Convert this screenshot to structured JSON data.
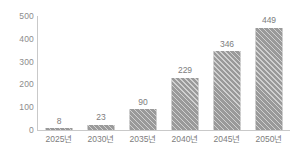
{
  "chart_data": {
    "type": "bar",
    "title": "",
    "subtitle": "",
    "xlabel": "",
    "ylabel": "",
    "categories": [
      "2025년",
      "2030년",
      "2035년",
      "2040년",
      "2045년",
      "2050년"
    ],
    "values": [
      8,
      23,
      90,
      229,
      346,
      449
    ],
    "value_labels": [
      "8",
      "23",
      "90",
      "229",
      "346",
      "449"
    ],
    "ylim": [
      0,
      500
    ],
    "y_ticks": [
      500,
      400,
      300,
      200,
      100,
      0
    ],
    "y_tick_labels": [
      "500",
      "400",
      "300",
      "200",
      "100",
      "0"
    ],
    "grid": false,
    "legend": false,
    "legend_position": "none",
    "series": [
      {
        "name": "",
        "values": [
          8,
          23,
          90,
          229,
          346,
          449
        ]
      }
    ],
    "style": {
      "bar_fill": "#9a9a9a",
      "bar_hatch": "diagonal",
      "axis_color": "#c9c9c9",
      "label_color": "#7d7d7d",
      "tick_color": "#8c8c8c",
      "background": "#ffffff"
    }
  }
}
